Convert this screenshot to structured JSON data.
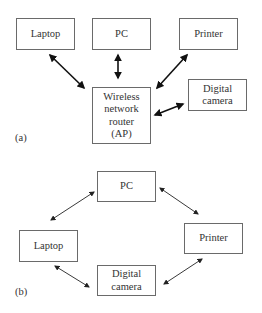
{
  "diagram_a": {
    "label": "(a)",
    "nodes": {
      "laptop": "Laptop",
      "pc": "PC",
      "printer": "Printer",
      "router": "Wireless network router (AP)",
      "router_lines": [
        "Wireless",
        "network",
        "router",
        "(AP)"
      ],
      "camera_lines": [
        "Digital",
        "camera"
      ]
    },
    "edges": [
      [
        "Laptop",
        "Wireless network router (AP)"
      ],
      [
        "PC",
        "Wireless network router (AP)"
      ],
      [
        "Printer",
        "Wireless network router (AP)"
      ],
      [
        "Digital camera",
        "Wireless network router (AP)"
      ]
    ],
    "topology": "infrastructure (star via access point)"
  },
  "diagram_b": {
    "label": "(b)",
    "nodes": {
      "pc": "PC",
      "laptop": "Laptop",
      "printer": "Printer",
      "camera_lines": [
        "Digital",
        "camera"
      ]
    },
    "edges": [
      [
        "PC",
        "Laptop"
      ],
      [
        "PC",
        "Printer"
      ],
      [
        "Laptop",
        "Digital camera"
      ],
      [
        "Printer",
        "Digital camera"
      ]
    ],
    "topology": "ad hoc (peer-to-peer ring)"
  }
}
